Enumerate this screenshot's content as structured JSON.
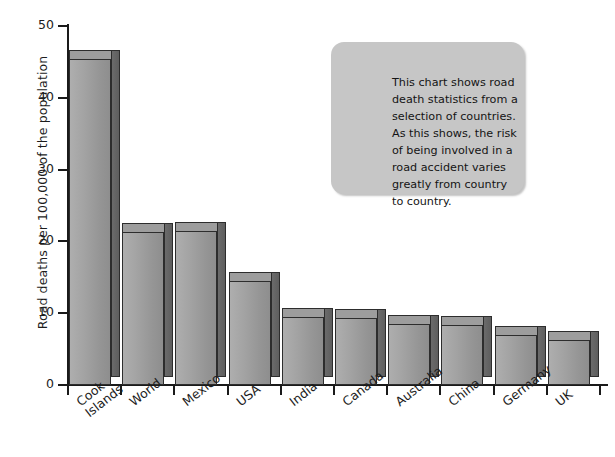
{
  "chart_data": {
    "type": "bar",
    "title": "",
    "subtitle": "",
    "xlabel": "",
    "ylabel": "Road deaths per 100,000 of the population",
    "categories": [
      "Cook Islands",
      "World",
      "Mexico",
      "USA",
      "India",
      "Canada",
      "Australia",
      "China",
      "Germany",
      "UK"
    ],
    "values": [
      45.4,
      21.3,
      21.4,
      14.5,
      9.5,
      9.4,
      8.5,
      8.3,
      7.0,
      6.2
    ],
    "series": [
      {
        "name": "Road deaths per 100,000",
        "values": [
          45.4,
          21.3,
          21.4,
          14.5,
          9.5,
          9.4,
          8.5,
          8.3,
          7.0,
          6.2
        ]
      }
    ],
    "ylim": [
      0,
      50
    ],
    "yticks": [
      0,
      10,
      20,
      30,
      40,
      50
    ],
    "ytick_labels": [
      "0",
      "10",
      "20",
      "30",
      "40",
      "50"
    ],
    "grid": false,
    "legend": false,
    "legend_position": "none",
    "bar_style": "3d",
    "colors": {
      "bar_face": "#a0a0a0",
      "bar_side": "#636363",
      "bar_outline": "#2d2d2d",
      "axis": "#1a1a1a",
      "text": "#1c1c1c",
      "callout_fill": "#c6c6c6",
      "background": "#ffffff"
    },
    "annotations": [
      {
        "name": "description-callout",
        "text": "This chart shows road death statistics from a selection of countries. As this shows, the risk of being involved in a road accident varies greatly from country to country."
      }
    ]
  },
  "axes": {
    "y_title": "Road deaths per 100,000 of the population",
    "y_ticks": [
      "50",
      "40",
      "30",
      "20",
      "10",
      "0"
    ],
    "x_labels": [
      "Cook Islands",
      "World",
      "Mexico",
      "USA",
      "India",
      "Canada",
      "Australia",
      "China",
      "Germany",
      "UK"
    ],
    "x_labels_wrapped": [
      [
        "Cook",
        "Islands"
      ],
      [
        "World"
      ],
      [
        "Mexico"
      ],
      [
        "USA"
      ],
      [
        "India"
      ],
      [
        "Canada"
      ],
      [
        "Australia"
      ],
      [
        "China"
      ],
      [
        "Germany"
      ],
      [
        "UK"
      ]
    ]
  },
  "callout": {
    "text": "This chart shows road death statistics from a selection of countries. As this shows, the risk of being involved in a road accident varies greatly from country to country."
  }
}
